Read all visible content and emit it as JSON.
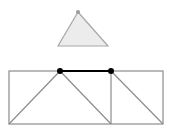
{
  "diagram": {
    "colors": {
      "background": "#ffffff",
      "triangle_fill": "#ececec",
      "triangle_stroke": "#a8a8a8",
      "apex_dot": "#9a9a9a",
      "frame_stroke": "#8c8c8c",
      "highlight_edge": "#000000",
      "node": "#000000"
    },
    "floating_triangle": {
      "apex": [
        78,
        12
      ],
      "base_left": [
        58,
        46
      ],
      "base_right": [
        108,
        46
      ]
    },
    "frame": {
      "outer_rect": {
        "x": 9,
        "y": 71,
        "width": 154,
        "height": 53
      },
      "divider_x": 111,
      "diagonals": [
        {
          "from": [
            9,
            124
          ],
          "to": [
            60,
            71
          ]
        },
        {
          "from": [
            60,
            71
          ],
          "to": [
            111,
            124
          ]
        },
        {
          "from": [
            111,
            71
          ],
          "to": [
            163,
            124
          ]
        }
      ],
      "highlight_edge": {
        "from": [
          60,
          71
        ],
        "to": [
          111,
          71
        ]
      },
      "nodes": [
        [
          60,
          71
        ],
        [
          111,
          71
        ]
      ]
    }
  }
}
